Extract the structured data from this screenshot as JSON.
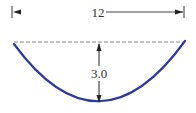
{
  "diagram": {
    "title": "",
    "width_dimension": {
      "label": "12",
      "x_start": 12,
      "x_end": 183,
      "y": 12,
      "line_color": "#444444",
      "accent_color": "#7fcf8a"
    },
    "depth_dimension": {
      "label": "3.0",
      "x": 99,
      "y_top": 43,
      "y_bottom": 104,
      "line_color": "#222222"
    },
    "reference_line": {
      "style": "dashed",
      "y": 42,
      "x_start": 14,
      "x_end": 185,
      "color": "#777777"
    },
    "curve": {
      "shape": "parabola",
      "color": "#2e3a9e",
      "left": [
        14,
        43
      ],
      "vertex": [
        99,
        104
      ],
      "right": [
        185,
        41
      ]
    }
  }
}
